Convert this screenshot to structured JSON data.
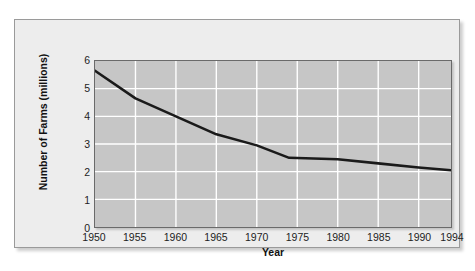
{
  "chart_data": {
    "type": "line",
    "title": "",
    "xlabel": "Year",
    "ylabel": "Number of Farms (millions)",
    "xlim": [
      1950,
      1994
    ],
    "ylim": [
      0,
      6
    ],
    "grid": true,
    "legend": "none",
    "x_tick_labels": [
      "1950",
      "1955",
      "1960",
      "1965",
      "1970",
      "1975",
      "1980",
      "1985",
      "1990",
      "1994"
    ],
    "x_ticks": [
      1950,
      1955,
      1960,
      1965,
      1970,
      1975,
      1980,
      1985,
      1990,
      1994
    ],
    "y_tick_labels": [
      "0",
      "1",
      "2",
      "3",
      "4",
      "5",
      "6"
    ],
    "y_ticks": [
      0,
      1,
      2,
      3,
      4,
      5,
      6
    ],
    "series": [
      {
        "name": "Number of Farms",
        "color": "#1a1a1a",
        "x": [
          1950,
          1955,
          1960,
          1965,
          1970,
          1974,
          1980,
          1985,
          1990,
          1994
        ],
        "values": [
          5.65,
          4.65,
          4.0,
          3.35,
          2.95,
          2.5,
          2.45,
          2.3,
          2.15,
          2.05
        ]
      }
    ],
    "colors": {
      "plot_background": "#c6c6c6",
      "panel_background": "#ededed",
      "gridline": "#ffffff",
      "line": "#1a1a1a",
      "axis": "#6a6a6a",
      "text": "#1d1d1d"
    }
  }
}
